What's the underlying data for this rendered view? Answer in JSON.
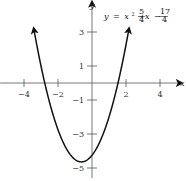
{
  "chart_data": {
    "type": "line",
    "title": "",
    "equation": {
      "lhs": "y",
      "eq": "=",
      "x2": "x",
      "sup": "2",
      "plus": "+",
      "frac1_num": "5",
      "frac1_den": "4",
      "x1": "x",
      "minus": "−",
      "frac2_num": "17",
      "frac2_den": "4"
    },
    "function": {
      "a": 1,
      "b": 1.25,
      "c": -4.25
    },
    "xlabel": "x",
    "ylabel": "y",
    "xlim": [
      -5.4,
      5.4
    ],
    "ylim": [
      -5.6,
      4.9
    ],
    "x_ticks": [
      {
        "value": -4,
        "label": "−4"
      },
      {
        "value": -2,
        "label": "−2"
      },
      {
        "value": 2,
        "label": "2"
      },
      {
        "value": 4,
        "label": "4"
      }
    ],
    "y_ticks": [
      {
        "value": 3,
        "label": "3"
      },
      {
        "value": 1,
        "label": "1"
      },
      {
        "value": -1,
        "label": "−1"
      },
      {
        "value": -3,
        "label": "−3"
      },
      {
        "value": -5,
        "label": "−5"
      }
    ],
    "curve_x_range": [
      -3.43,
      2.18
    ],
    "curve_arrows": "both-ends",
    "grid": false,
    "colors": {
      "curve": "#111111",
      "axis": "#555555"
    }
  }
}
